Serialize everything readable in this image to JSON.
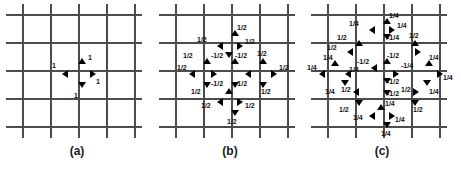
{
  "figure": {
    "background_color": "#ffffff",
    "grid_color": "#4c4c4c",
    "arrow_color": "#000000",
    "label_color": "#111111",
    "panels": [
      {
        "id": "a",
        "caption": "(a)",
        "grid": {
          "vertical_lines_x": [
            22,
            50,
            78,
            106,
            134
          ],
          "horizontal_lines_y": [
            14,
            42,
            70,
            98,
            126
          ]
        },
        "center": {
          "x": 78,
          "y": 70
        },
        "arrows": [
          {
            "name": "arrow-up",
            "dir": "up",
            "x": 78,
            "y": 58,
            "label": "1",
            "lx": 88,
            "ly": 54
          },
          {
            "name": "arrow-down",
            "dir": "down",
            "x": 78,
            "y": 82,
            "label": "1",
            "lx": 74,
            "ly": 92
          },
          {
            "name": "arrow-left",
            "dir": "left",
            "x": 62,
            "y": 70,
            "label": "1",
            "lx": 52,
            "ly": 62
          },
          {
            "name": "arrow-right",
            "dir": "right",
            "x": 90,
            "y": 70,
            "label": "1",
            "lx": 96,
            "ly": 78
          }
        ]
      },
      {
        "id": "b",
        "caption": "(b)",
        "grid": {
          "vertical_lines_x": [
            22,
            50,
            78,
            106,
            134
          ],
          "horizontal_lines_y": [
            14,
            42,
            70,
            98,
            126
          ]
        },
        "center": {
          "x": 78,
          "y": 70
        },
        "arrows": [
          {
            "name": "arrow-outer-up",
            "dir": "up",
            "x": 78,
            "y": 30,
            "label": "1/2",
            "lx": 84,
            "ly": 24
          },
          {
            "name": "arrow-inner-up-right",
            "dir": "right",
            "x": 84,
            "y": 42,
            "label": "1/2",
            "lx": 92,
            "ly": 38
          },
          {
            "name": "arrow-inner-up-left",
            "dir": "left",
            "x": 64,
            "y": 42,
            "label": "1/2",
            "lx": 44,
            "ly": 36
          },
          {
            "name": "arrow-left-up",
            "dir": "up",
            "x": 50,
            "y": 58,
            "label": "1/2",
            "lx": 30,
            "ly": 52
          },
          {
            "name": "arrow-center-up",
            "dir": "up",
            "x": 78,
            "y": 58,
            "label": "-1/2",
            "lx": 82,
            "ly": 52
          },
          {
            "name": "arrow-center-up-left",
            "dir": "down",
            "x": 72,
            "y": 52,
            "label": "-1/2",
            "lx": 58,
            "ly": 52
          },
          {
            "name": "arrow-outer-left",
            "dir": "left",
            "x": 36,
            "y": 70,
            "label": "1/2",
            "lx": 24,
            "ly": 64
          },
          {
            "name": "arrow-inner-left",
            "dir": "right",
            "x": 58,
            "y": 70,
            "label": "",
            "lx": 0,
            "ly": 0
          },
          {
            "name": "arrow-inner-right",
            "dir": "left",
            "x": 92,
            "y": 70,
            "label": "",
            "lx": 0,
            "ly": 0
          },
          {
            "name": "arrow-right-up",
            "dir": "up",
            "x": 106,
            "y": 58,
            "label": "1/2",
            "lx": 104,
            "ly": 50
          },
          {
            "name": "arrow-outer-right",
            "dir": "right",
            "x": 118,
            "y": 70,
            "label": "1/2",
            "lx": 126,
            "ly": 64
          },
          {
            "name": "arrow-center-down",
            "dir": "down",
            "x": 78,
            "y": 82,
            "label": "-1/2",
            "lx": 82,
            "ly": 80
          },
          {
            "name": "arrow-center-down-left",
            "dir": "up",
            "x": 72,
            "y": 88,
            "label": "-1/2",
            "lx": 58,
            "ly": 80
          },
          {
            "name": "arrow-left-down",
            "dir": "down",
            "x": 50,
            "y": 82,
            "label": "1/2",
            "lx": 38,
            "ly": 88
          },
          {
            "name": "arrow-right-down",
            "dir": "down",
            "x": 106,
            "y": 82,
            "label": "1/2",
            "lx": 108,
            "ly": 88
          },
          {
            "name": "arrow-inner-down-left",
            "dir": "left",
            "x": 64,
            "y": 98,
            "label": "1/2",
            "lx": 48,
            "ly": 102
          },
          {
            "name": "arrow-inner-down-right",
            "dir": "right",
            "x": 84,
            "y": 98,
            "label": "1/2",
            "lx": 92,
            "ly": 102
          },
          {
            "name": "arrow-outer-down",
            "dir": "down",
            "x": 78,
            "y": 110,
            "label": "1/2",
            "lx": 74,
            "ly": 118
          }
        ]
      },
      {
        "id": "c",
        "caption": "(c)",
        "grid": {
          "vertical_lines_x": [
            22,
            50,
            78,
            106,
            134
          ],
          "horizontal_lines_y": [
            14,
            42,
            70,
            98,
            126
          ]
        },
        "center": {
          "x": 78,
          "y": 70
        },
        "arrows": [
          {
            "name": "arrow-top-up",
            "dir": "up",
            "x": 78,
            "y": 18,
            "label": "1/4",
            "lx": 84,
            "ly": 12
          },
          {
            "name": "arrow-top-left",
            "dir": "left",
            "x": 64,
            "y": 26,
            "label": "1/4",
            "lx": 44,
            "ly": 20
          },
          {
            "name": "arrow-top-right",
            "dir": "right",
            "x": 84,
            "y": 26,
            "label": "1/4",
            "lx": 92,
            "ly": 22
          },
          {
            "name": "arrow-upper-center-down",
            "dir": "down",
            "x": 78,
            "y": 34,
            "label": "-1/4",
            "lx": 82,
            "ly": 34
          },
          {
            "name": "arrow-upper-left-up",
            "dir": "up",
            "x": 50,
            "y": 40,
            "label": "1/2",
            "lx": 32,
            "ly": 34
          },
          {
            "name": "arrow-upper-right-up",
            "dir": "up",
            "x": 106,
            "y": 40,
            "label": "1/2",
            "lx": 104,
            "ly": 32
          },
          {
            "name": "arrow-upper-left-inward",
            "dir": "left",
            "x": 42,
            "y": 48,
            "label": "1/2",
            "lx": 22,
            "ly": 44
          },
          {
            "name": "arrow-upper-right-inward",
            "dir": "right",
            "x": 110,
            "y": 48,
            "label": "",
            "lx": 0,
            "ly": 0
          },
          {
            "name": "arrow-far-left-up",
            "dir": "up",
            "x": 26,
            "y": 60,
            "label": "1/4",
            "lx": 18,
            "ly": 54
          },
          {
            "name": "arrow-far-left-out",
            "dir": "left",
            "x": 14,
            "y": 70,
            "label": "1/4",
            "lx": 2,
            "ly": 64
          },
          {
            "name": "arrow-mid-left-in",
            "dir": "left",
            "x": 40,
            "y": 70,
            "label": "1/4",
            "lx": 44,
            "ly": 66
          },
          {
            "name": "arrow-center-up",
            "dir": "up",
            "x": 78,
            "y": 58,
            "label": "-1/2",
            "lx": 82,
            "ly": 52
          },
          {
            "name": "arrow-center-up-left",
            "dir": "left",
            "x": 66,
            "y": 64,
            "label": "-1/2",
            "lx": 52,
            "ly": 58
          },
          {
            "name": "arrow-center-right-in",
            "dir": "right",
            "x": 88,
            "y": 70,
            "label": "-1/4",
            "lx": 96,
            "ly": 62
          },
          {
            "name": "arrow-far-right-up",
            "dir": "up",
            "x": 120,
            "y": 60,
            "label": "1/4",
            "lx": 124,
            "ly": 54
          },
          {
            "name": "arrow-far-right-out",
            "dir": "right",
            "x": 132,
            "y": 70,
            "label": "1/4",
            "lx": 138,
            "ly": 74
          },
          {
            "name": "arrow-center-down",
            "dir": "down",
            "x": 78,
            "y": 78,
            "label": "-1/2",
            "lx": 82,
            "ly": 78
          },
          {
            "name": "arrow-center-down-2",
            "dir": "down",
            "x": 78,
            "y": 90,
            "label": "-1/2",
            "lx": 82,
            "ly": 90
          },
          {
            "name": "arrow-lower-left-down",
            "dir": "down",
            "x": 36,
            "y": 80,
            "label": "1/4",
            "lx": 20,
            "ly": 88
          },
          {
            "name": "arrow-lower-left-in",
            "dir": "left",
            "x": 48,
            "y": 88,
            "label": "1/2",
            "lx": 36,
            "ly": 86
          },
          {
            "name": "arrow-lower-right-down",
            "dir": "down",
            "x": 118,
            "y": 80,
            "label": "1/4",
            "lx": 124,
            "ly": 88
          },
          {
            "name": "arrow-lower-right-in",
            "dir": "right",
            "x": 108,
            "y": 88,
            "label": "1/2",
            "lx": 96,
            "ly": 86
          },
          {
            "name": "arrow-bottom-left-down",
            "dir": "down",
            "x": 50,
            "y": 100,
            "label": "1/2",
            "lx": 34,
            "ly": 106
          },
          {
            "name": "arrow-bottom-right-down",
            "dir": "down",
            "x": 106,
            "y": 100,
            "label": "1/2",
            "lx": 108,
            "ly": 106
          },
          {
            "name": "arrow-bottom-center-up",
            "dir": "up",
            "x": 72,
            "y": 104,
            "label": "1/4",
            "lx": 80,
            "ly": 100
          },
          {
            "name": "arrow-bottom-left-in",
            "dir": "left",
            "x": 64,
            "y": 112,
            "label": "1/4",
            "lx": 48,
            "ly": 114
          },
          {
            "name": "arrow-bottom-right-in",
            "dir": "right",
            "x": 84,
            "y": 112,
            "label": "1/4",
            "lx": 90,
            "ly": 116
          },
          {
            "name": "arrow-bottom-down",
            "dir": "down",
            "x": 78,
            "y": 122,
            "label": "1/4",
            "lx": 76,
            "ly": 130
          }
        ]
      }
    ]
  }
}
